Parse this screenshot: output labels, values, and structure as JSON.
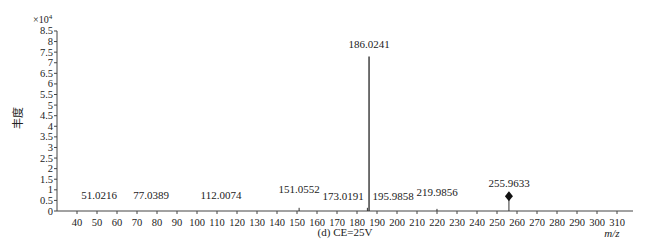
{
  "chart_data": {
    "type": "bar",
    "subtype": "mass-spectrum-stick",
    "title": "",
    "caption": "(d) CE=25V",
    "xlabel": "m/z",
    "ylabel": "丰度",
    "y_multiplier": "×10⁴",
    "xlim": [
      30,
      318
    ],
    "ylim": [
      0,
      8.5
    ],
    "x_ticks": [
      40,
      50,
      60,
      70,
      80,
      90,
      100,
      110,
      120,
      130,
      140,
      150,
      160,
      170,
      180,
      190,
      200,
      210,
      220,
      230,
      240,
      250,
      260,
      270,
      280,
      290,
      300,
      310
    ],
    "y_ticks": [
      0,
      0.5,
      1,
      1.5,
      2,
      2.5,
      3,
      3.5,
      4,
      4.5,
      5,
      5.5,
      6,
      6.5,
      7,
      7.5,
      8,
      8.5
    ],
    "y_tick_labels": [
      "0",
      "0.5",
      "1",
      "1.5",
      "2",
      "2.5",
      "3",
      "3.5",
      "4",
      "4.5",
      "5",
      "5.5",
      "6",
      "6.5",
      "7",
      "7.5",
      "8",
      "8.5"
    ],
    "grid": false,
    "legend": null,
    "peaks": [
      {
        "mz": 51.0216,
        "label": "51.0216",
        "intensity": 0.0,
        "label_x": 51.0
      },
      {
        "mz": 77.0389,
        "label": "77.0389",
        "intensity": 0.0,
        "label_x": 77.0
      },
      {
        "mz": 112.0074,
        "label": "112.0074",
        "intensity": 0.0,
        "label_x": 112.0
      },
      {
        "mz": 151.0552,
        "label": "151.0552",
        "intensity": 0.15,
        "label_x": 151.0
      },
      {
        "mz": 173.0191,
        "label": "173.0191",
        "intensity": 0.0,
        "label_x": 173.0
      },
      {
        "mz": 186.0241,
        "label": "186.0241",
        "intensity": 7.3,
        "label_x": 186.0,
        "base_peak": true
      },
      {
        "mz": 185.2,
        "label": "",
        "intensity": 0.15,
        "label_x": 185.2
      },
      {
        "mz": 195.9858,
        "label": "195.9858",
        "intensity": 0.0,
        "label_x": 198.0
      },
      {
        "mz": 219.9856,
        "label": "219.9856",
        "intensity": 0.1,
        "label_x": 220.0
      },
      {
        "mz": 255.9633,
        "label": "255.9633",
        "intensity": 0.7,
        "label_x": 256.0,
        "marker": "diamond"
      }
    ]
  },
  "colors": {
    "axis": "#444444",
    "stick": "#333333",
    "text": "#222222",
    "background": "#ffffff"
  }
}
